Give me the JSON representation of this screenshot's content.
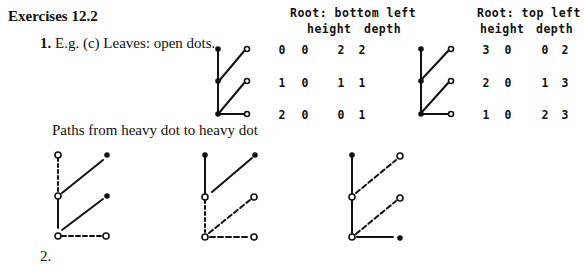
{
  "section_title": "Exercises 12.2",
  "item1": {
    "number": "1.",
    "text": "E.g. (c) Leaves: open dots."
  },
  "tables": [
    {
      "title": "Root: bottom left",
      "col_height": "height",
      "col_depth": "depth",
      "rows": [
        [
          "0",
          "0",
          "2",
          "2"
        ],
        [
          "1",
          "0",
          "1",
          "1"
        ],
        [
          "2",
          "0",
          "0",
          "1"
        ]
      ]
    },
    {
      "title": "Root: top left",
      "col_height": "height",
      "col_depth": "depth",
      "rows": [
        [
          "3",
          "0",
          "0",
          "2"
        ],
        [
          "2",
          "0",
          "1",
          "3"
        ],
        [
          "1",
          "0",
          "2",
          "3"
        ]
      ]
    }
  ],
  "paths_caption": "Paths from heavy dot to heavy dot",
  "item2_partial": "2."
}
